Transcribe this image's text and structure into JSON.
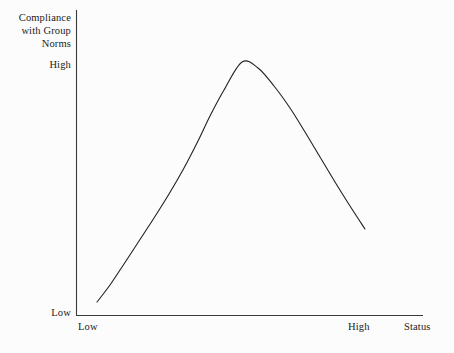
{
  "chart_data": {
    "type": "line",
    "title": "",
    "subtitle": "",
    "ylabel": "Compliance with Group Norms",
    "ylabel_lines": [
      "Compliance",
      "with Group",
      "Norms"
    ],
    "xlabel": "Status",
    "ytick_labels": [
      "High",
      "Low"
    ],
    "xtick_labels": [
      "Low",
      "High"
    ],
    "ylim": [
      0,
      1
    ],
    "xlim": [
      0,
      1
    ],
    "grid": false,
    "legend": null,
    "annotations": [],
    "series": [
      {
        "name": "Compliance vs Status",
        "x": [
          0.06,
          0.12,
          0.19,
          0.26,
          0.33,
          0.4,
          0.46,
          0.51,
          0.55,
          0.6,
          0.66,
          0.72,
          0.78,
          0.84,
          0.9,
          0.95,
          1.0,
          1.04,
          1.08
        ],
        "y": [
          0.04,
          0.14,
          0.26,
          0.38,
          0.5,
          0.62,
          0.74,
          0.85,
          0.92,
          0.97,
          0.99,
          0.97,
          0.92,
          0.85,
          0.75,
          0.64,
          0.52,
          0.4,
          0.3
        ],
        "points_px": [
          [
            97,
            302
          ],
          [
            110,
            285
          ],
          [
            124,
            264
          ],
          [
            139,
            241
          ],
          [
            154,
            218
          ],
          [
            169,
            194
          ],
          [
            184,
            168
          ],
          [
            198,
            141
          ],
          [
            210,
            116
          ],
          [
            224,
            90
          ],
          [
            242,
            62
          ],
          [
            258,
            68
          ],
          [
            274,
            86
          ],
          [
            290,
            108
          ],
          [
            305,
            132
          ],
          [
            320,
            157
          ],
          [
            335,
            182
          ],
          [
            350,
            206
          ],
          [
            365,
            229
          ]
        ],
        "color": "#222222",
        "width_px": 1.1,
        "shape": "inverted-u-curve",
        "peak_px": [
          242,
          61
        ],
        "start_px": [
          97,
          302
        ],
        "end_px": [
          365,
          229
        ]
      }
    ],
    "axes_px": {
      "y_axis": {
        "x": 76,
        "y_top": 10,
        "y_bottom": 315
      },
      "x_axis": {
        "y": 315,
        "x_left": 76,
        "x_right": 423
      },
      "color": "#3a3a3a",
      "width_px": 1
    }
  },
  "colors": {
    "background": "#fcfcfc",
    "axis": "#3a3a3a",
    "curve": "#222222",
    "text": "#1b1b1b"
  }
}
